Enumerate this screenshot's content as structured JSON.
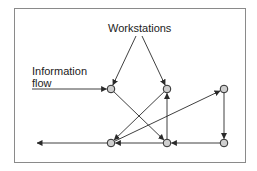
{
  "diagram": {
    "labels": {
      "workstations": "Workstations",
      "information_flow": "Information flow",
      "information_flow_lines": [
        "Information",
        "flow"
      ]
    },
    "colors": {
      "stroke": "#2a2a2a",
      "node_fill": "#cfcfcf",
      "frame": "#8a8a8a"
    },
    "nodes": [
      {
        "id": "A",
        "row": "top",
        "col": 1
      },
      {
        "id": "B",
        "row": "top",
        "col": 2
      },
      {
        "id": "C",
        "row": "top",
        "col": 3
      },
      {
        "id": "D",
        "row": "bottom",
        "col": 1
      },
      {
        "id": "E",
        "row": "bottom",
        "col": 2
      },
      {
        "id": "F",
        "row": "bottom",
        "col": 3
      }
    ],
    "edges": [
      {
        "from": "input",
        "to": "A"
      },
      {
        "from": "workstations-label",
        "to": "A"
      },
      {
        "from": "workstations-label",
        "to": "B"
      },
      {
        "from": "A",
        "to": "E"
      },
      {
        "from": "B",
        "to": "D"
      },
      {
        "from": "D",
        "to": "C"
      },
      {
        "from": "E",
        "to": "B"
      },
      {
        "from": "E",
        "to": "D"
      },
      {
        "from": "C",
        "to": "F"
      },
      {
        "from": "F",
        "to": "E"
      },
      {
        "from": "D",
        "to": "output"
      }
    ]
  }
}
